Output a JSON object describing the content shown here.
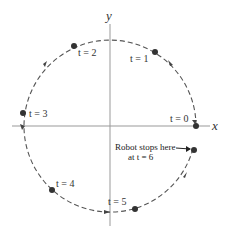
{
  "diagram": {
    "type": "robot-circular-path",
    "axes": {
      "x_label": "x",
      "y_label": "y"
    },
    "center": [
      110,
      126
    ],
    "radius": 86,
    "points": [
      {
        "label": "t = 0",
        "angle_deg": 0
      },
      {
        "label": "t = 1",
        "angle_deg": 58
      },
      {
        "label": "t = 2",
        "angle_deg": 116
      },
      {
        "label": "t = 3",
        "angle_deg": 171
      },
      {
        "label": "t = 4",
        "angle_deg": 229
      },
      {
        "label": "t = 5",
        "angle_deg": 284
      },
      {
        "label": "t = 6",
        "angle_deg": 344
      }
    ],
    "annotation": {
      "line1": "Robot stops here",
      "line2": "at t = 6"
    },
    "colors": {
      "path": "#555555",
      "axis": "#888888",
      "point": "#333333"
    }
  }
}
